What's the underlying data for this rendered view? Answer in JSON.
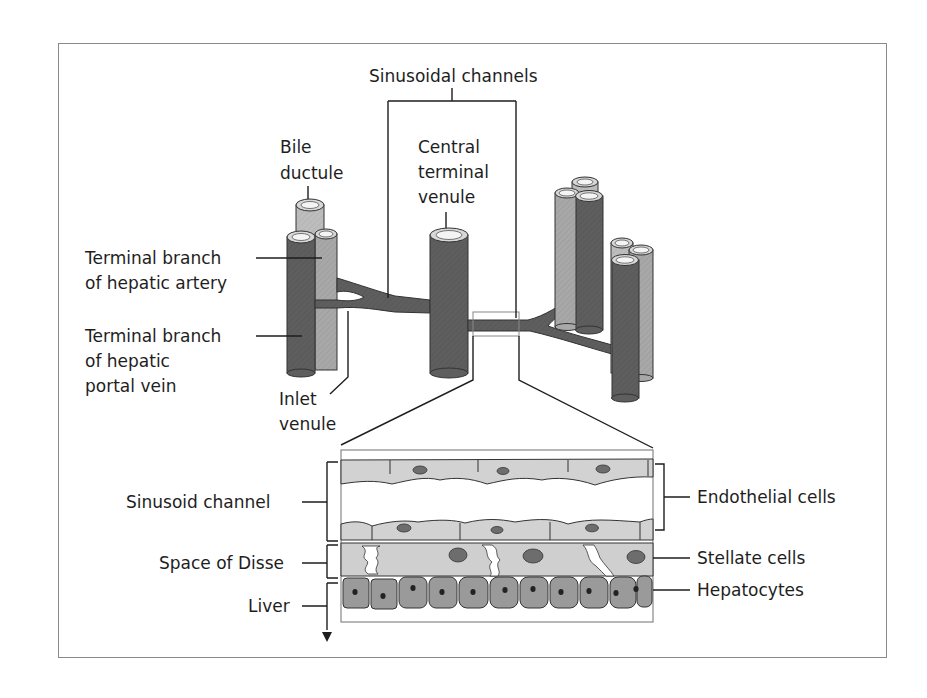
{
  "figure": {
    "colors": {
      "portal_vein": "#5e5e5e",
      "artery": "#a8a8a8",
      "bile_duct": "#bdbdbd",
      "lumen": "#eeeeee",
      "endothelial": "#d2d2d2",
      "stellate": "#cfcfcf",
      "hepatocyte": "#9a9a9a",
      "nucleus_dark": "#6d6d6d",
      "frame": "#8a8a8a",
      "text": "#1e1e1e"
    },
    "labels": {
      "sinusoidal_channels": "Sinusoidal channels",
      "bile_ductule": [
        "Bile",
        "ductule"
      ],
      "central_venule": [
        "Central",
        "terminal",
        "venule"
      ],
      "hepatic_artery": [
        "Terminal branch",
        "of hepatic artery"
      ],
      "portal_vein": [
        "Terminal branch",
        "of hepatic",
        "portal vein"
      ],
      "inlet_venule": [
        "Inlet",
        "venule"
      ],
      "sinusoid_channel": "Sinusoid  channel",
      "space_of_disse": "Space of Disse",
      "liver": "Liver",
      "endothelial_cells": "Endothelial cells",
      "stellate_cells": "Stellate cells",
      "hepatocytes": "Hepatocytes"
    }
  }
}
